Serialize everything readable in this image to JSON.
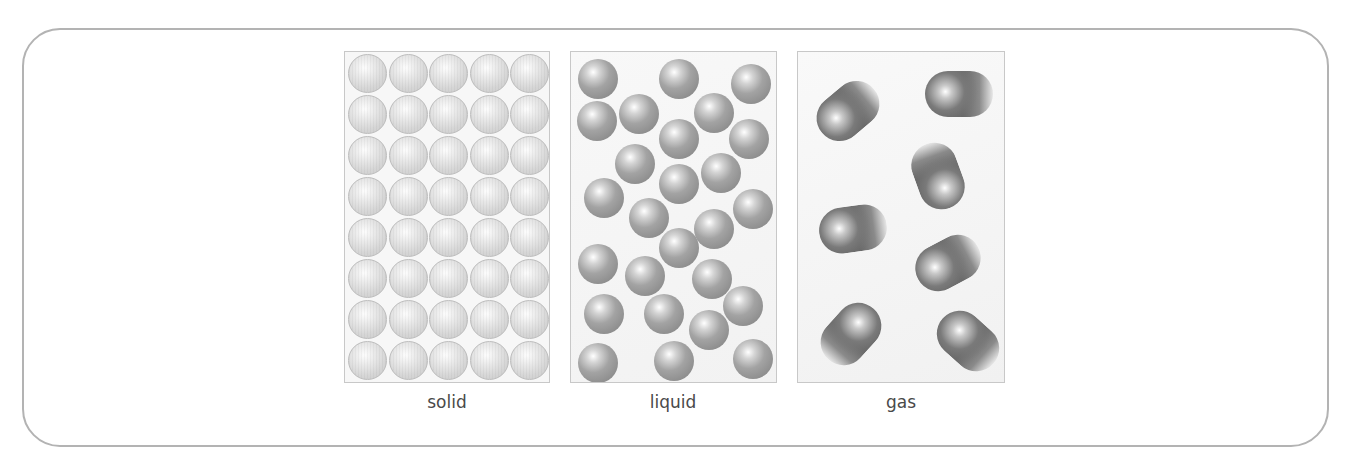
{
  "figure": {
    "panels": [
      {
        "id": "solid",
        "label": "solid"
      },
      {
        "id": "liquid",
        "label": "liquid"
      },
      {
        "id": "gas",
        "label": "gas"
      }
    ]
  },
  "solid_grid": {
    "columns": 5,
    "rows": 8
  },
  "liquid_particle_count": 26,
  "gas_particle_count": 7,
  "colors": {
    "frame_border": "#b3b3b3",
    "panel_border": "#c8c8c8",
    "label_text": "#4a4a4a",
    "solid_particle": "#d6d6d6",
    "liquid_particle": "#9a9a9a",
    "gas_particle": "#6a6a6a"
  }
}
